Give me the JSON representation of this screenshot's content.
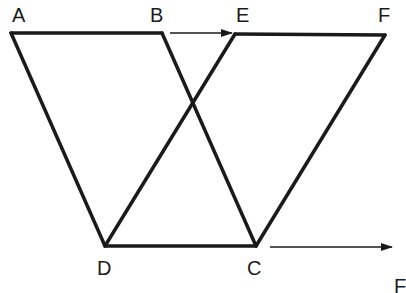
{
  "diagram": {
    "colors": {
      "stroke": "#1a1a1a",
      "background": "#ffffff"
    },
    "points": {
      "A": {
        "label": "A",
        "x": 11,
        "y": 33
      },
      "B": {
        "label": "B",
        "x": 162,
        "y": 33
      },
      "E": {
        "label": "E",
        "x": 235,
        "y": 34
      },
      "F": {
        "label": "F",
        "x": 385,
        "y": 35
      },
      "D": {
        "label": "D",
        "x": 105,
        "y": 246
      },
      "C": {
        "label": "C",
        "x": 256,
        "y": 246
      }
    },
    "segments": [
      {
        "from": "A",
        "to": "B"
      },
      {
        "from": "A",
        "to": "D"
      },
      {
        "from": "B",
        "to": "C"
      },
      {
        "from": "D",
        "to": "C"
      },
      {
        "from": "E",
        "to": "F"
      },
      {
        "from": "E",
        "to": "D"
      },
      {
        "from": "F",
        "to": "C"
      }
    ],
    "arrows": [
      {
        "name": "top-arrow",
        "x1": 170,
        "y1": 33,
        "x2": 232,
        "y2": 33
      },
      {
        "name": "bottom-arrow",
        "x1": 270,
        "y1": 247,
        "x2": 392,
        "y2": 247
      }
    ],
    "labels": {
      "A": "A",
      "B": "B",
      "E": "E",
      "F": "F",
      "D": "D",
      "C": "C",
      "corner_partial": "F"
    }
  }
}
